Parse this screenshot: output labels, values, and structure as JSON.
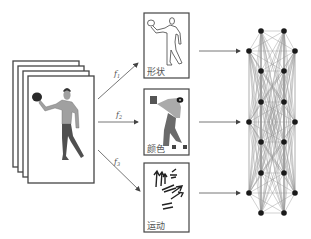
{
  "diagram": {
    "input": {
      "name": "video-frames",
      "frame_count": 4
    },
    "mappings": [
      {
        "id": "f1",
        "label": "f",
        "subscript": "1",
        "target": "shape"
      },
      {
        "id": "f2",
        "label": "f",
        "subscript": "2",
        "target": "color"
      },
      {
        "id": "f3",
        "label": "f",
        "subscript": "3",
        "target": "motion"
      }
    ],
    "features": [
      {
        "id": "shape",
        "label": "形状"
      },
      {
        "id": "color",
        "label": "颜色"
      },
      {
        "id": "motion",
        "label": "运动"
      }
    ],
    "graph": {
      "name": "fully-connected-graph",
      "node_count": 18,
      "nodes": [
        [
          261,
          31
        ],
        [
          284,
          31
        ],
        [
          249,
          51
        ],
        [
          295,
          51
        ],
        [
          261,
          71
        ],
        [
          284,
          71
        ],
        [
          261,
          102
        ],
        [
          284,
          102
        ],
        [
          249,
          122
        ],
        [
          295,
          122
        ],
        [
          261,
          142
        ],
        [
          284,
          142
        ],
        [
          261,
          173
        ],
        [
          284,
          173
        ],
        [
          249,
          193
        ],
        [
          295,
          193
        ],
        [
          261,
          213
        ],
        [
          284,
          213
        ]
      ]
    },
    "colors": {
      "line": "#555555",
      "frame_border": "#444444",
      "node": "#1a1a1a",
      "edge": "#9a9a9a",
      "skin": "#a0a0a0",
      "pants": "#505050",
      "ball": "#2a2a2a"
    }
  }
}
